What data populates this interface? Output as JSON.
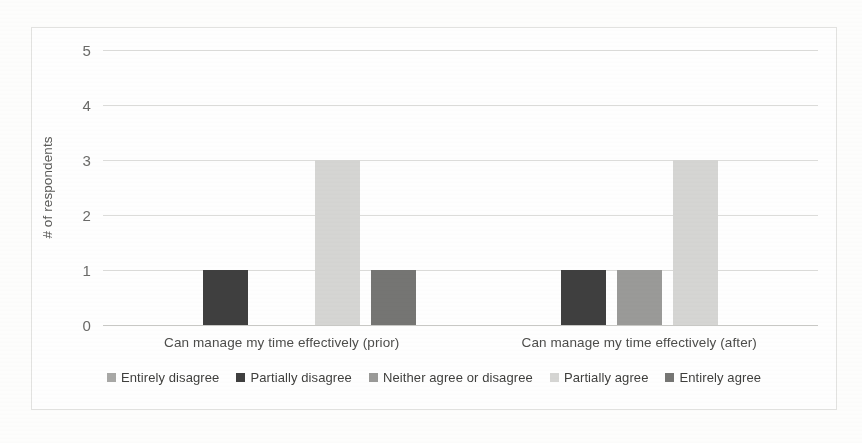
{
  "chart_data": {
    "type": "bar",
    "title": "",
    "subtitle": "",
    "xlabel": "",
    "ylabel": "# of respondents",
    "ylim": [
      0,
      5
    ],
    "yticks": [
      "0",
      "1",
      "2",
      "3",
      "4",
      "5"
    ],
    "grid": true,
    "legend_position": "bottom",
    "categories": [
      "Can manage my time effectively (prior)",
      "Can manage my time effectively (after)"
    ],
    "series": [
      {
        "name": "Entirely disagree",
        "color": "#a8a8a6",
        "values": [
          0,
          0
        ]
      },
      {
        "name": "Partially disagree",
        "color": "#3f3f3f",
        "values": [
          1,
          1
        ]
      },
      {
        "name": "Neither agree or disagree",
        "color": "#9a9a98",
        "values": [
          0,
          1
        ]
      },
      {
        "name": "Partially agree",
        "color": "#d5d5d3",
        "values": [
          3,
          3
        ]
      },
      {
        "name": "Entirely agree",
        "color": "#757573",
        "values": [
          1,
          0
        ]
      }
    ]
  },
  "axis": {
    "y_title": "# of respondents",
    "y_ticks": [
      "5",
      "4",
      "3",
      "2",
      "1",
      "0"
    ]
  },
  "legend": {
    "items": [
      {
        "label": "Entirely disagree"
      },
      {
        "label": "Partially disagree"
      },
      {
        "label": "Neither agree or disagree"
      },
      {
        "label": "Partially agree"
      },
      {
        "label": "Entirely agree"
      }
    ]
  }
}
